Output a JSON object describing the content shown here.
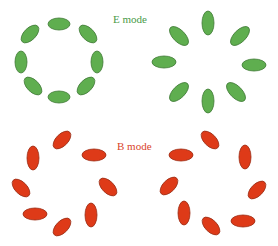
{
  "labels": {
    "e_mode": "E mode",
    "b_mode": "B mode"
  },
  "colors": {
    "e_fill": "#5fae4f",
    "e_stroke": "#3f7a35",
    "e_text": "#4a9a48",
    "b_fill": "#de3a18",
    "b_stroke": "#9a2a12",
    "b_text": "#d9452a"
  },
  "panels": [
    {
      "name": "e-mode-tangential",
      "mode": "E",
      "pattern": "tangential ring"
    },
    {
      "name": "e-mode-radial",
      "mode": "E",
      "pattern": "radial star"
    },
    {
      "name": "b-mode-ccw",
      "mode": "B",
      "pattern": "curl pattern"
    },
    {
      "name": "b-mode-cw",
      "mode": "B",
      "pattern": "curl pattern"
    }
  ]
}
